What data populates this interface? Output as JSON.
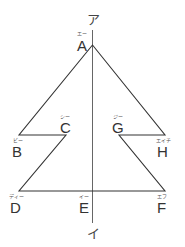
{
  "diagram": {
    "type": "line-symmetric figure",
    "axis": {
      "top_label": "ア",
      "bottom_label": "イ",
      "x": 92.5,
      "y1": 30,
      "y2": 223
    },
    "points": [
      {
        "name": "A",
        "reading": "エー",
        "x": 92.5,
        "y": 45
      },
      {
        "name": "B",
        "reading": "ビー",
        "x": 19,
        "y": 135
      },
      {
        "name": "C",
        "reading": "シー",
        "x": 66,
        "y": 135
      },
      {
        "name": "D",
        "reading": "ディー",
        "x": 19,
        "y": 191
      },
      {
        "name": "E",
        "reading": "イー",
        "x": 92.5,
        "y": 191
      },
      {
        "name": "F",
        "reading": "エフ",
        "x": 165,
        "y": 191
      },
      {
        "name": "G",
        "reading": "ジー",
        "x": 119,
        "y": 135
      },
      {
        "name": "H",
        "reading": "エイチ",
        "x": 165,
        "y": 135
      }
    ],
    "outline": "A-B-C-D-F-G-H-A",
    "stroke_color": "#333333"
  }
}
